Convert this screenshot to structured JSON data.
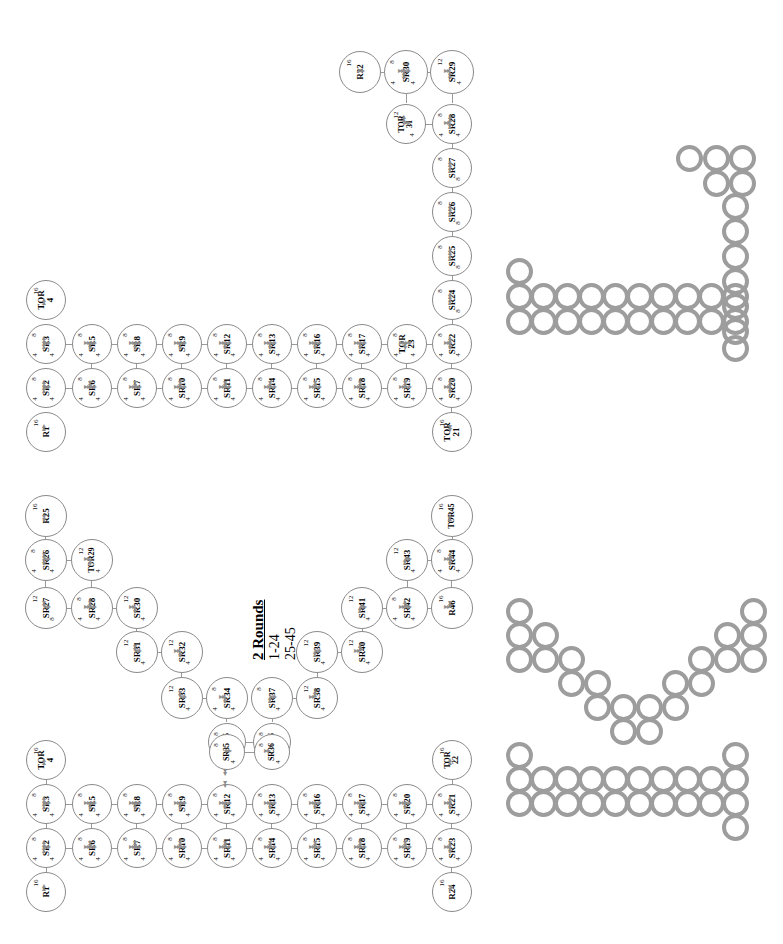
{
  "diagram": {
    "title_caption": {
      "line1": "2 Rounds",
      "line2": "1-24",
      "line3": "25-45"
    },
    "orientation": "rotated-90-ccw",
    "node_shape": "circle",
    "edge_label_values": [
      "4",
      "8",
      "12",
      "16"
    ],
    "clusters": [
      {
        "name": "cluster-right-round1",
        "nodes": [
          {
            "id": "R1",
            "weight": "16",
            "ports": []
          },
          {
            "id": "SR2",
            "weight": "8",
            "ports": [
              "4",
              "4"
            ]
          },
          {
            "id": "SR3",
            "weight": "8",
            "ports": [
              "4",
              "4"
            ]
          },
          {
            "id": "TOR4",
            "weight": "16",
            "ports": []
          },
          {
            "id": "SR5",
            "weight": "8",
            "ports": [
              "4",
              "4"
            ]
          },
          {
            "id": "SR6",
            "weight": "8",
            "ports": [
              "4",
              "4"
            ]
          },
          {
            "id": "SR7",
            "weight": "8",
            "ports": [
              "4",
              "4"
            ]
          },
          {
            "id": "SR8",
            "weight": "8",
            "ports": [
              "4",
              "4"
            ]
          },
          {
            "id": "SR9",
            "weight": "8",
            "ports": [
              "4",
              "4"
            ]
          },
          {
            "id": "SR10",
            "weight": "8",
            "ports": [
              "4",
              "4"
            ]
          },
          {
            "id": "SR11",
            "weight": "8",
            "ports": [
              "4",
              "4"
            ]
          },
          {
            "id": "SR12",
            "weight": "8",
            "ports": [
              "4",
              "4"
            ]
          },
          {
            "id": "SR13",
            "weight": "8",
            "ports": [
              "4",
              "4"
            ]
          },
          {
            "id": "SR14",
            "weight": "8",
            "ports": [
              "4",
              "4"
            ]
          },
          {
            "id": "SR15",
            "weight": "8",
            "ports": [
              "4",
              "4"
            ]
          },
          {
            "id": "SR16",
            "weight": "8",
            "ports": [
              "4",
              "4"
            ]
          },
          {
            "id": "SR17",
            "weight": "8",
            "ports": [
              "4",
              "4"
            ]
          },
          {
            "id": "SR18",
            "weight": "8",
            "ports": [
              "4",
              "4"
            ]
          },
          {
            "id": "SR19",
            "weight": "8",
            "ports": [
              "4",
              "4"
            ]
          },
          {
            "id": "SR20",
            "weight": "8",
            "ports": [
              "4",
              "4"
            ]
          },
          {
            "id": "TOR21",
            "weight": "16",
            "ports": []
          },
          {
            "id": "SR22",
            "weight": "8",
            "ports": [
              "4",
              "4"
            ]
          },
          {
            "id": "TOR23",
            "weight": "8",
            "ports": [
              "4",
              "4"
            ]
          },
          {
            "id": "SR24",
            "weight": "8",
            "ports": [
              "8"
            ]
          },
          {
            "id": "SR25",
            "weight": "8",
            "ports": [
              "8"
            ]
          },
          {
            "id": "SR26",
            "weight": "8",
            "ports": [
              "8"
            ]
          },
          {
            "id": "SR27",
            "weight": "8",
            "ports": [
              "8"
            ]
          },
          {
            "id": "SR28",
            "weight": "8",
            "ports": [
              "4",
              "4"
            ]
          },
          {
            "id": "SR29",
            "weight": "12",
            "ports": [
              "4"
            ]
          },
          {
            "id": "SR30",
            "weight": "8",
            "ports": [
              "4",
              "4"
            ]
          },
          {
            "id": "TOR31",
            "weight": "12",
            "ports": [
              "4"
            ]
          },
          {
            "id": "R32",
            "weight": "16",
            "ports": []
          }
        ]
      },
      {
        "name": "cluster-middle-round2",
        "nodes": [
          {
            "id": "R25",
            "weight": "16",
            "ports": []
          },
          {
            "id": "SR26",
            "weight": "8",
            "ports": [
              "4",
              "4"
            ]
          },
          {
            "id": "SR27",
            "weight": "12",
            "ports": [
              "8"
            ]
          },
          {
            "id": "SR28",
            "weight": "8",
            "ports": [
              "4",
              "4"
            ]
          },
          {
            "id": "TOR29",
            "weight": "12",
            "ports": [
              "4"
            ]
          },
          {
            "id": "SR30",
            "weight": "12",
            "ports": [
              "4"
            ]
          },
          {
            "id": "SR31",
            "weight": "12",
            "ports": [
              "4"
            ]
          },
          {
            "id": "SR32",
            "weight": "12",
            "ports": [
              "4"
            ]
          },
          {
            "id": "SR33",
            "weight": "12",
            "ports": [
              "4"
            ]
          },
          {
            "id": "SR34",
            "weight": "8",
            "ports": [
              "4",
              "4"
            ]
          },
          {
            "id": "SR35",
            "weight": "8",
            "ports": [
              "4"
            ]
          },
          {
            "id": "SR36",
            "weight": "8",
            "ports": [
              "4"
            ]
          },
          {
            "id": "SR37",
            "weight": "8",
            "ports": [
              "4"
            ]
          },
          {
            "id": "SR38",
            "weight": "12",
            "ports": [
              "4"
            ]
          },
          {
            "id": "SR39",
            "weight": "12",
            "ports": [
              "4"
            ]
          },
          {
            "id": "SR40",
            "weight": "12",
            "ports": [
              "4"
            ]
          },
          {
            "id": "SR41",
            "weight": "12",
            "ports": [
              "4"
            ]
          },
          {
            "id": "SR42",
            "weight": "8",
            "ports": [
              "4",
              "4"
            ]
          },
          {
            "id": "SR43",
            "weight": "12",
            "ports": [
              "4"
            ]
          },
          {
            "id": "SR44",
            "weight": "8",
            "ports": [
              "4",
              "4"
            ]
          },
          {
            "id": "TOR45",
            "weight": "16",
            "ports": []
          },
          {
            "id": "R46",
            "weight": "16",
            "ports": []
          }
        ]
      },
      {
        "name": "cluster-left-round1",
        "nodes": [
          {
            "id": "R1",
            "weight": "16",
            "ports": []
          },
          {
            "id": "SR2",
            "weight": "8",
            "ports": [
              "4",
              "4"
            ]
          },
          {
            "id": "SR3",
            "weight": "8",
            "ports": [
              "4",
              "4"
            ]
          },
          {
            "id": "TOR4",
            "weight": "16",
            "ports": []
          },
          {
            "id": "SR5",
            "weight": "8",
            "ports": [
              "4",
              "4"
            ]
          },
          {
            "id": "SR6",
            "weight": "8",
            "ports": [
              "4",
              "4"
            ]
          },
          {
            "id": "SR7",
            "weight": "8",
            "ports": [
              "4",
              "4"
            ]
          },
          {
            "id": "SR8",
            "weight": "8",
            "ports": [
              "4",
              "4"
            ]
          },
          {
            "id": "SR9",
            "weight": "8",
            "ports": [
              "4",
              "4"
            ]
          },
          {
            "id": "SR10",
            "weight": "8",
            "ports": [
              "4",
              "4"
            ]
          },
          {
            "id": "SR11",
            "weight": "8",
            "ports": [
              "4",
              "4"
            ]
          },
          {
            "id": "SR12",
            "weight": "8",
            "ports": [
              "4",
              "4"
            ]
          },
          {
            "id": "SR13",
            "weight": "8",
            "ports": [
              "4",
              "4"
            ]
          },
          {
            "id": "SR14",
            "weight": "8",
            "ports": [
              "4",
              "4"
            ]
          },
          {
            "id": "SR15",
            "weight": "8",
            "ports": [
              "4",
              "4"
            ]
          },
          {
            "id": "SR16",
            "weight": "8",
            "ports": [
              "4",
              "4"
            ]
          },
          {
            "id": "SR17",
            "weight": "8",
            "ports": [
              "4",
              "4"
            ]
          },
          {
            "id": "SR18",
            "weight": "8",
            "ports": [
              "4",
              "4"
            ]
          },
          {
            "id": "SR19",
            "weight": "8",
            "ports": [
              "4",
              "4"
            ]
          },
          {
            "id": "SR20",
            "weight": "8",
            "ports": [
              "4",
              "4"
            ]
          },
          {
            "id": "SR21",
            "weight": "8",
            "ports": [
              "4",
              "4"
            ]
          },
          {
            "id": "TOR22",
            "weight": "16",
            "ports": []
          },
          {
            "id": "SR23",
            "weight": "8",
            "ports": [
              "4",
              "4"
            ]
          },
          {
            "id": "R24",
            "weight": "16",
            "ports": []
          },
          {
            "id": "SR35",
            "weight": "8",
            "ports": [
              "4"
            ]
          },
          {
            "id": "SR36",
            "weight": "8",
            "ports": [
              "4"
            ]
          }
        ]
      }
    ],
    "thumbnails": [
      {
        "name": "thumbnail-top-right"
      },
      {
        "name": "thumbnail-middle"
      },
      {
        "name": "thumbnail-bottom"
      }
    ]
  }
}
